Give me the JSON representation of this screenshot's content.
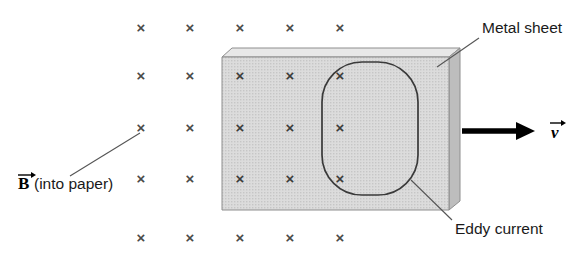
{
  "figure": {
    "background_color": "#ffffff"
  },
  "labels": {
    "magnetic_field": {
      "symbol": "B",
      "qualifier": "(into paper)",
      "full": "B (into paper)",
      "x": 18,
      "y": 188
    },
    "metal_sheet": {
      "text": "Metal sheet",
      "x": 482,
      "y": 33
    },
    "eddy_current": {
      "text": "Eddy current",
      "x": 455,
      "y": 234
    },
    "velocity": {
      "symbol": "v",
      "x": 553,
      "y": 137
    }
  },
  "field_marks": {
    "glyph": "×",
    "semantic": "field-into-page-marker",
    "color": "#4a4a4a",
    "columns": [
      141,
      190,
      240,
      290,
      340,
      390
    ],
    "rows": [
      27,
      75,
      127,
      178,
      237
    ],
    "positions": [
      {
        "x": 141,
        "y": 27,
        "on_sheet": false
      },
      {
        "x": 190,
        "y": 27,
        "on_sheet": false
      },
      {
        "x": 240,
        "y": 27,
        "on_sheet": false
      },
      {
        "x": 290,
        "y": 27,
        "on_sheet": false
      },
      {
        "x": 340,
        "y": 27,
        "on_sheet": false
      },
      {
        "x": 141,
        "y": 75,
        "on_sheet": false
      },
      {
        "x": 190,
        "y": 75,
        "on_sheet": false
      },
      {
        "x": 240,
        "y": 75,
        "on_sheet": true
      },
      {
        "x": 290,
        "y": 75,
        "on_sheet": true
      },
      {
        "x": 340,
        "y": 75,
        "on_sheet": true
      },
      {
        "x": 141,
        "y": 127,
        "on_sheet": false
      },
      {
        "x": 190,
        "y": 127,
        "on_sheet": false
      },
      {
        "x": 240,
        "y": 127,
        "on_sheet": true
      },
      {
        "x": 290,
        "y": 127,
        "on_sheet": true
      },
      {
        "x": 340,
        "y": 127,
        "on_sheet": true
      },
      {
        "x": 141,
        "y": 178,
        "on_sheet": false
      },
      {
        "x": 190,
        "y": 178,
        "on_sheet": false
      },
      {
        "x": 240,
        "y": 178,
        "on_sheet": true
      },
      {
        "x": 290,
        "y": 178,
        "on_sheet": true
      },
      {
        "x": 340,
        "y": 178,
        "on_sheet": true
      },
      {
        "x": 141,
        "y": 237,
        "on_sheet": false
      },
      {
        "x": 190,
        "y": 237,
        "on_sheet": false
      },
      {
        "x": 240,
        "y": 237,
        "on_sheet": false
      },
      {
        "x": 290,
        "y": 237,
        "on_sheet": false
      },
      {
        "x": 340,
        "y": 237,
        "on_sheet": false
      }
    ]
  },
  "metal_sheet_shape": {
    "front_face": "222,57 449,57 449,210 222,210",
    "top_face": "222,57 232,48 460,48 449,57",
    "side_face": "449,57 460,48 460,201 449,210",
    "face_color": "#d6d6d6",
    "top_color": "#e8e8e8",
    "side_color": "#bdbdbd",
    "outline_color": "#8e8e8e"
  },
  "eddy_loop": {
    "shape": "rounded-rectangle",
    "x": 322,
    "y": 62,
    "width": 96,
    "height": 133,
    "corner_radius": 40,
    "stroke_color": "#3a3a3a"
  },
  "velocity_arrow": {
    "x1": 462,
    "y1": 131,
    "x2": 530,
    "y2": 131,
    "color": "#000000",
    "direction": "right"
  },
  "leader_lines": [
    {
      "name": "b-field-leader",
      "x1": 70,
      "y1": 176,
      "x2": 140,
      "y2": 133
    },
    {
      "name": "metal-sheet-leader",
      "x1": 437,
      "y1": 67,
      "x2": 479,
      "y2": 38
    },
    {
      "name": "eddy-current-leader",
      "x1": 411,
      "y1": 180,
      "x2": 452,
      "y2": 220
    }
  ]
}
